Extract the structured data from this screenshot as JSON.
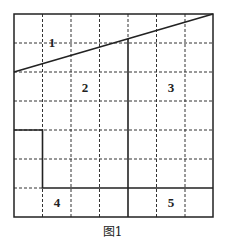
{
  "figure": {
    "caption": "图1",
    "grid": {
      "columns": 7,
      "rows": 7
    },
    "regions": [
      {
        "id": "1",
        "label": "1"
      },
      {
        "id": "2",
        "label": "2"
      },
      {
        "id": "3",
        "label": "3"
      },
      {
        "id": "4",
        "label": "4"
      },
      {
        "id": "5",
        "label": "5"
      }
    ],
    "colors": {
      "line": "#222222",
      "background": "#ffffff"
    }
  }
}
